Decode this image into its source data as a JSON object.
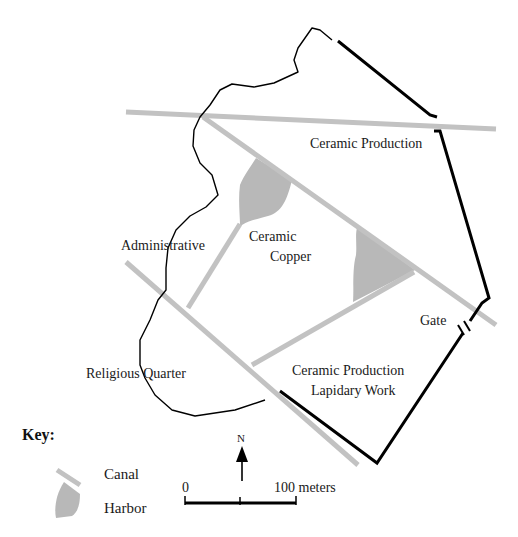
{
  "map": {
    "labels": {
      "ceramic_production_north": "Ceramic Production",
      "administrative": "Administrative",
      "ceramic": "Ceramic",
      "copper": "Copper",
      "gate": "Gate",
      "religious_quarter": "Religious Quarter",
      "ceramic_production_south": "Ceramic Production",
      "lapidary_work": "Lapidary Work"
    },
    "colors": {
      "canal": "#c0c0c0",
      "harbor": "#b8b8b8",
      "wall": "#000000",
      "shoreline": "#000000"
    }
  },
  "key": {
    "title": "Key:",
    "items": [
      {
        "symbol": "canal",
        "label": "Canal"
      },
      {
        "symbol": "harbor",
        "label": "Harbor"
      }
    ]
  },
  "north_arrow": {
    "label": "N"
  },
  "scale_bar": {
    "start_label": "0",
    "end_label": "100 meters"
  }
}
